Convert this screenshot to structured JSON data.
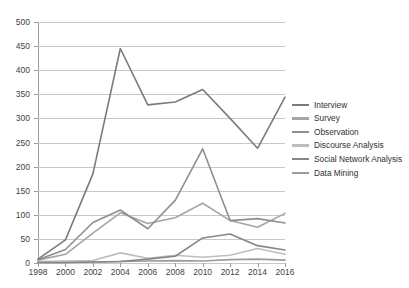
{
  "chart_data": {
    "type": "line",
    "title": "",
    "xlabel": "",
    "ylabel": "",
    "x": [
      1998,
      2000,
      2002,
      2004,
      2006,
      2008,
      2010,
      2012,
      2014,
      2016
    ],
    "categories": [
      "1998",
      "2000",
      "2002",
      "2004",
      "2006",
      "2008",
      "2010",
      "2012",
      "2014",
      "2016"
    ],
    "xlim": [
      1998,
      2016
    ],
    "ylim": [
      0,
      500
    ],
    "ytick_step": 50,
    "yticks": [
      0,
      50,
      100,
      150,
      200,
      250,
      300,
      350,
      400,
      450,
      500
    ],
    "ytick_labels": [
      "0",
      "50",
      "100",
      "150",
      "200",
      "250",
      "300",
      "350",
      "400",
      "450",
      "500"
    ],
    "grid": "horizontal",
    "legend_position": "right",
    "series": [
      {
        "name": "Interview",
        "color": "#7b7b7b",
        "values": [
          8,
          48,
          185,
          445,
          328,
          334,
          360,
          300,
          238,
          344
        ]
      },
      {
        "name": "Survey",
        "color": "#a5a5a5",
        "values": [
          6,
          18,
          62,
          104,
          82,
          94,
          124,
          88,
          74,
          103
        ]
      },
      {
        "name": "Observation",
        "color": "#8f8f8f",
        "values": [
          7,
          28,
          84,
          110,
          71,
          130,
          237,
          88,
          92,
          83
        ]
      },
      {
        "name": "Discourse Analysis",
        "color": "#bdbdbd",
        "values": [
          3,
          4,
          5,
          21,
          10,
          16,
          12,
          16,
          30,
          18
        ]
      },
      {
        "name": "Social Network Analysis",
        "color": "#868686",
        "values": [
          1,
          1,
          2,
          3,
          8,
          14,
          52,
          60,
          36,
          27
        ]
      },
      {
        "name": "Data Mining",
        "color": "#9c9c9c",
        "values": [
          1,
          1,
          2,
          3,
          4,
          5,
          4,
          7,
          8,
          6
        ]
      }
    ]
  },
  "axes": {
    "y_color": "#9a9a9a",
    "x_color": "#9a9a9a",
    "gridline_color": "#c8c8c8",
    "tick_label_color": "#3f3f3f"
  },
  "legend": {
    "items": [
      {
        "label": "Interview"
      },
      {
        "label": "Survey"
      },
      {
        "label": "Observation"
      },
      {
        "label": "Discourse Analysis"
      },
      {
        "label": "Social Network Analysis"
      },
      {
        "label": "Data Mining"
      }
    ]
  }
}
